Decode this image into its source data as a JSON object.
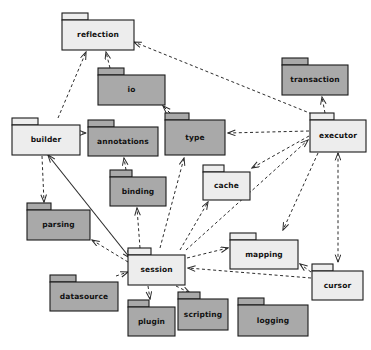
{
  "diagram": {
    "type": "uml-package-diagram",
    "title": "",
    "canvas": {
      "width": 371,
      "height": 350
    },
    "background": "#ffffff",
    "colors": {
      "light_fill": "#ededed",
      "dark_fill": "#a9a9a9",
      "stroke": "#1b1b1b",
      "dependency_stroke": "#2b2b2b"
    },
    "packages": [
      {
        "id": "reflection",
        "label": "reflection",
        "fill": "light",
        "x": 62,
        "y": 13,
        "w": 72,
        "h": 37,
        "tab_w": 26,
        "tab_h": 7
      },
      {
        "id": "io",
        "label": "io",
        "fill": "dark",
        "x": 98,
        "y": 68,
        "w": 67,
        "h": 37,
        "tab_w": 26,
        "tab_h": 7
      },
      {
        "id": "transaction",
        "label": "transaction",
        "fill": "dark",
        "x": 282,
        "y": 58,
        "w": 66,
        "h": 37,
        "tab_w": 26,
        "tab_h": 7
      },
      {
        "id": "builder",
        "label": "builder",
        "fill": "light",
        "x": 12,
        "y": 118,
        "w": 68,
        "h": 37,
        "tab_w": 26,
        "tab_h": 7
      },
      {
        "id": "annotations",
        "label": "annotations",
        "fill": "dark",
        "x": 88,
        "y": 120,
        "w": 70,
        "h": 36,
        "tab_w": 26,
        "tab_h": 7
      },
      {
        "id": "type",
        "label": "type",
        "fill": "dark",
        "x": 165,
        "y": 113,
        "w": 60,
        "h": 42,
        "tab_w": 24,
        "tab_h": 7
      },
      {
        "id": "executor",
        "label": "executor",
        "fill": "light",
        "x": 310,
        "y": 113,
        "w": 56,
        "h": 39,
        "tab_w": 24,
        "tab_h": 7
      },
      {
        "id": "binding",
        "label": "binding",
        "fill": "dark",
        "x": 110,
        "y": 170,
        "w": 56,
        "h": 36,
        "tab_w": 22,
        "tab_h": 7
      },
      {
        "id": "cache",
        "label": "cache",
        "fill": "light",
        "x": 203,
        "y": 165,
        "w": 47,
        "h": 35,
        "tab_w": 21,
        "tab_h": 7
      },
      {
        "id": "parsing",
        "label": "parsing",
        "fill": "dark",
        "x": 27,
        "y": 203,
        "w": 63,
        "h": 37,
        "tab_w": 24,
        "tab_h": 7
      },
      {
        "id": "mapping",
        "label": "mapping",
        "fill": "light",
        "x": 230,
        "y": 233,
        "w": 68,
        "h": 36,
        "tab_w": 26,
        "tab_h": 7
      },
      {
        "id": "session",
        "label": "session",
        "fill": "light",
        "x": 128,
        "y": 248,
        "w": 57,
        "h": 37,
        "tab_w": 23,
        "tab_h": 7
      },
      {
        "id": "cursor",
        "label": "cursor",
        "fill": "light",
        "x": 312,
        "y": 264,
        "w": 51,
        "h": 36,
        "tab_w": 21,
        "tab_h": 7
      },
      {
        "id": "datasource",
        "label": "datasource",
        "fill": "dark",
        "x": 50,
        "y": 275,
        "w": 68,
        "h": 36,
        "tab_w": 26,
        "tab_h": 7
      },
      {
        "id": "plugin",
        "label": "plugin",
        "fill": "dark",
        "x": 128,
        "y": 300,
        "w": 47,
        "h": 36,
        "tab_w": 21,
        "tab_h": 7
      },
      {
        "id": "scripting",
        "label": "scripting",
        "fill": "dark",
        "x": 178,
        "y": 292,
        "w": 50,
        "h": 38,
        "tab_w": 22,
        "tab_h": 7
      },
      {
        "id": "logging",
        "label": "logging",
        "fill": "dark",
        "x": 238,
        "y": 298,
        "w": 70,
        "h": 38,
        "tab_w": 26,
        "tab_h": 7
      }
    ],
    "dependencies": [
      {
        "from": "builder",
        "to": "reflection",
        "style": "dashed",
        "points": "58,118 86,52"
      },
      {
        "from": "io",
        "to": "reflection",
        "style": "dashed",
        "points": "110,68 106,52"
      },
      {
        "from": "executor",
        "to": "reflection",
        "style": "dashed",
        "points": "312,114 134,42"
      },
      {
        "from": "executor",
        "to": "transaction",
        "style": "dashed",
        "points": "325,113 322,97"
      },
      {
        "from": "type",
        "to": "io",
        "style": "dashed",
        "points": "170,113 163,106"
      },
      {
        "from": "executor",
        "to": "type",
        "style": "dashed",
        "points": "309,131 228,133"
      },
      {
        "from": "builder",
        "to": "annotations",
        "style": "dashed",
        "points": "82,133 86,133"
      },
      {
        "from": "builder",
        "to": "parsing",
        "style": "dashed",
        "points": "42,156 44,202"
      },
      {
        "from": "builder",
        "to": "session",
        "style": "solid",
        "points": "48,155 130,258"
      },
      {
        "from": "binding",
        "to": "annotations",
        "style": "dashed",
        "points": "126,170 124,158"
      },
      {
        "from": "session",
        "to": "binding",
        "style": "dashed",
        "points": "140,248 137,208"
      },
      {
        "from": "session",
        "to": "type",
        "style": "dashed",
        "points": "160,248 184,158"
      },
      {
        "from": "session",
        "to": "cache",
        "style": "dashed",
        "points": "180,250 208,202"
      },
      {
        "from": "session",
        "to": "executor",
        "style": "dashed",
        "points": "186,250 308,140"
      },
      {
        "from": "executor",
        "to": "cache",
        "style": "dashed",
        "points": "309,136 252,168"
      },
      {
        "from": "executor",
        "to": "mapping",
        "style": "dashed",
        "points": "318,153 283,230"
      },
      {
        "from": "executor",
        "to": "cursor",
        "style": "dashed",
        "points": "338,153 338,262",
        "bidirectional": true
      },
      {
        "from": "session",
        "to": "mapping",
        "style": "dashed",
        "points": "187,258 228,248"
      },
      {
        "from": "cursor",
        "to": "mapping",
        "style": "dashed",
        "points": "311,272 300,264"
      },
      {
        "from": "cursor",
        "to": "session",
        "style": "dashed",
        "points": "311,278 188,268"
      },
      {
        "from": "session",
        "to": "parsing",
        "style": "dashed",
        "points": "128,262 92,240"
      },
      {
        "from": "datasource",
        "to": "session",
        "style": "dashed",
        "points": "116,276 128,272"
      },
      {
        "from": "session",
        "to": "plugin",
        "style": "dashed",
        "points": "148,286 150,299"
      },
      {
        "from": "session",
        "to": "scripting",
        "style": "dashed",
        "points": "176,286 190,293"
      }
    ]
  }
}
